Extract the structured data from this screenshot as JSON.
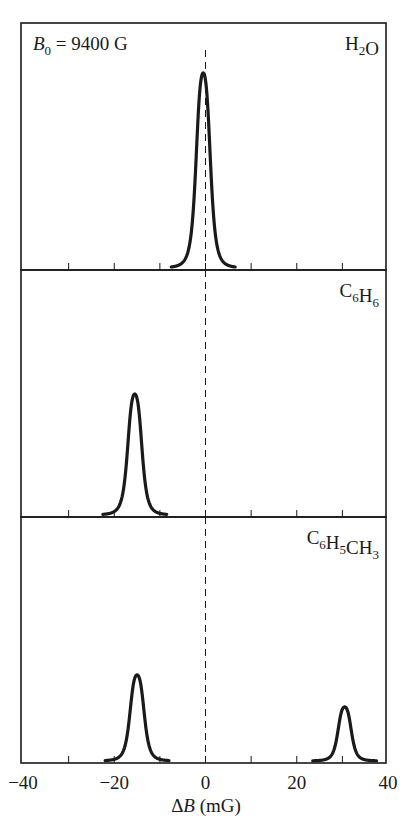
{
  "chart_data": {
    "type": "line",
    "title": "",
    "xlabel": "ΔB (mG)",
    "ylabel": "",
    "xlim": [
      -40,
      40
    ],
    "xticks_major": [
      -40,
      -20,
      0,
      20,
      40
    ],
    "xtick_labels": [
      "−40",
      "−20",
      "0",
      "20",
      "40"
    ],
    "xticks_minor": [
      -30,
      -20,
      -10,
      0,
      10,
      20,
      30
    ],
    "grid": false,
    "legend": null,
    "reference_line": {
      "x": 0,
      "style": "dashed"
    },
    "annotation": {
      "text": "B0 = 9400 G",
      "symbol": "B",
      "subscript": "0",
      "rest": " = 9400 G"
    },
    "panels": [
      {
        "label": "H2O",
        "label_parts": [
          [
            "H",
            ""
          ],
          [
            "2",
            "sub"
          ],
          [
            "O",
            ""
          ]
        ],
        "peaks": [
          {
            "center": -0.5,
            "height": 0.79,
            "width": 1.6
          }
        ]
      },
      {
        "label": "C6H6",
        "label_parts": [
          [
            "C",
            ""
          ],
          [
            "6",
            "sub"
          ],
          [
            "H",
            ""
          ],
          [
            "6",
            "sub"
          ]
        ],
        "peaks": [
          {
            "center": -15.5,
            "height": 0.49,
            "width": 1.6
          }
        ]
      },
      {
        "label": "C6H5CH3",
        "label_parts": [
          [
            "C",
            ""
          ],
          [
            "6",
            "sub"
          ],
          [
            "H",
            ""
          ],
          [
            "5",
            "sub"
          ],
          [
            "CH",
            ""
          ],
          [
            "3",
            "sub"
          ]
        ],
        "peaks": [
          {
            "center": -15.0,
            "height": 0.35,
            "width": 1.6
          },
          {
            "center": 30.5,
            "height": 0.22,
            "width": 1.5
          }
        ]
      }
    ],
    "colors": {
      "line": "#1a1a1a",
      "background": "#ffffff"
    }
  }
}
